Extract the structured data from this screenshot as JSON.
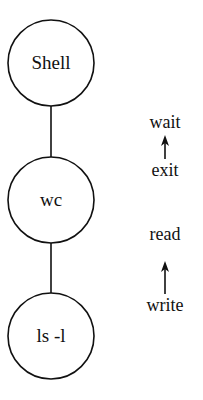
{
  "diagram": {
    "nodes": [
      {
        "id": "shell",
        "label": "Shell"
      },
      {
        "id": "wc",
        "label": "wc"
      },
      {
        "id": "ls",
        "label": "ls -l"
      }
    ],
    "edges": [
      {
        "from": "shell",
        "to": "wc"
      },
      {
        "from": "wc",
        "to": "ls"
      }
    ],
    "annotations": [
      {
        "top": "wait",
        "bottom": "exit",
        "arrow": "up"
      },
      {
        "top": "read",
        "bottom": "write",
        "arrow": "up"
      }
    ]
  }
}
